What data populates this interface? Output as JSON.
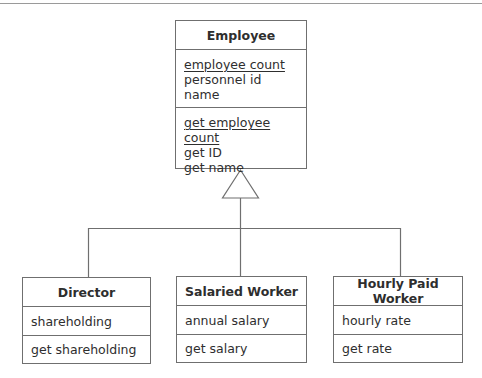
{
  "diagram": {
    "type": "UML class diagram (generalization)",
    "colors": {
      "line": "#6f6f6f",
      "text": "#2e2e2e",
      "background": "#ffffff"
    },
    "superclass": {
      "name": "Employee",
      "attributes": [
        {
          "label": "employee count",
          "static": true
        },
        {
          "label": "personnel id",
          "static": false
        },
        {
          "label": "name",
          "static": false
        }
      ],
      "operations": [
        {
          "label": "get employee count",
          "static": true
        },
        {
          "label": "get ID",
          "static": false
        },
        {
          "label": "get name",
          "static": false
        }
      ]
    },
    "subclasses": [
      {
        "name": "Director",
        "attributes": [
          {
            "label": "shareholding"
          }
        ],
        "operations": [
          {
            "label": "get shareholding"
          }
        ]
      },
      {
        "name": "Salaried Worker",
        "attributes": [
          {
            "label": "annual salary"
          }
        ],
        "operations": [
          {
            "label": "get salary"
          }
        ]
      },
      {
        "name": "Hourly Paid Worker",
        "attributes": [
          {
            "label": "hourly rate"
          }
        ],
        "operations": [
          {
            "label": "get rate"
          }
        ]
      }
    ],
    "relationships": [
      {
        "type": "generalization",
        "from": "Director",
        "to": "Employee"
      },
      {
        "type": "generalization",
        "from": "Salaried Worker",
        "to": "Employee"
      },
      {
        "type": "generalization",
        "from": "Hourly Paid Worker",
        "to": "Employee"
      }
    ]
  }
}
